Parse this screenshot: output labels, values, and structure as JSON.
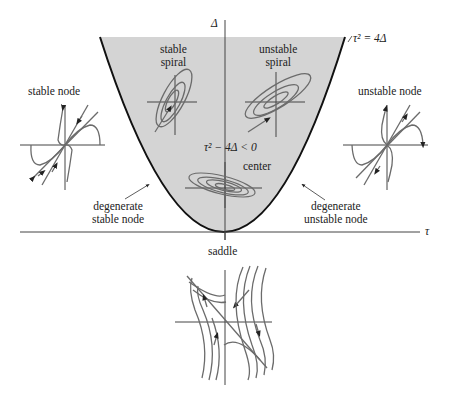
{
  "diagram": {
    "axes": {
      "x_label": "τ",
      "y_label": "Δ"
    },
    "curve_label": "τ² = 4Δ",
    "region_label": "τ² − 4Δ < 0",
    "regions": [
      {
        "id": "stable-spiral",
        "line1": "stable",
        "line2": "spiral"
      },
      {
        "id": "unstable-spiral",
        "line1": "unstable",
        "line2": "spiral"
      },
      {
        "id": "center",
        "label": "center"
      },
      {
        "id": "stable-node",
        "label": "stable node"
      },
      {
        "id": "unstable-node",
        "label": "unstable node"
      },
      {
        "id": "degenerate-stable-node",
        "line1": "degenerate",
        "line2": "stable node"
      },
      {
        "id": "degenerate-unstable-node",
        "line1": "degenerate",
        "line2": "unstable node"
      },
      {
        "id": "saddle",
        "label": "saddle"
      }
    ],
    "colors": {
      "shaded_region": "#d4d4d4",
      "parabola": "#111111",
      "axes": "#333333",
      "trajectories": "#6b6b6b"
    }
  }
}
